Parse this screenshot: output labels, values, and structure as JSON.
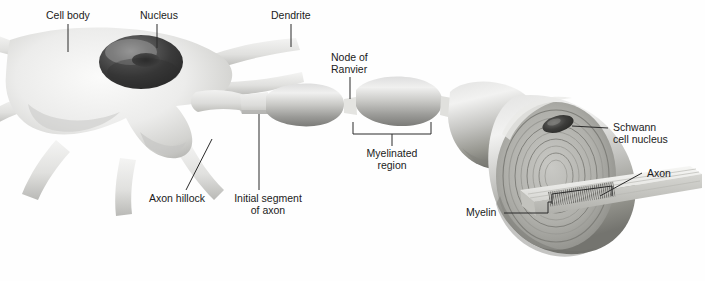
{
  "figure": {
    "background_color": "#fefefe",
    "ink_color": "#1b1b1b"
  },
  "labels": [
    {
      "id": "cell-body",
      "text": "Cell body",
      "x": 46,
      "y": 10,
      "align": "left"
    },
    {
      "id": "nucleus",
      "text": "Nucleus",
      "x": 140,
      "y": 10,
      "align": "left"
    },
    {
      "id": "dendrite",
      "text": "Dendrite",
      "x": 271,
      "y": 10,
      "align": "left"
    },
    {
      "id": "node-of-ranvier",
      "text": "Node of\nRanvier",
      "x": 331,
      "y": 52,
      "align": "left"
    },
    {
      "id": "myelinated-region",
      "text": "Myelinated\nregion",
      "x": 336,
      "y": 148,
      "align": "left"
    },
    {
      "id": "axon-hillock",
      "text": "Axon hillock",
      "x": 149,
      "y": 193,
      "align": "left"
    },
    {
      "id": "initial-segment",
      "text": "Initial segment\nof axon",
      "x": 224,
      "y": 193,
      "align": "left"
    },
    {
      "id": "schwann-nucleus",
      "text": "Schwann\ncell nucleus",
      "x": 613,
      "y": 122,
      "align": "left"
    },
    {
      "id": "axon",
      "text": "Axon",
      "x": 647,
      "y": 168,
      "align": "left"
    },
    {
      "id": "myelin",
      "text": "Myelin",
      "x": 466,
      "y": 209,
      "align": "left"
    }
  ],
  "structures": {
    "soma": "cell-body-with-dendrites",
    "nucleus": "dark-ellipse-with-nucleolus",
    "axon_hillock": "tapered-cone",
    "initial_segment": "thin-pale-tube",
    "myelin_internodes": 4,
    "nodes_of_ranvier": 3,
    "cutaway": "concentric-myelin-wraps-exposing-axon"
  },
  "palette": {
    "membrane_light": "#f2f2f1",
    "membrane_mid": "#d8d8d6",
    "membrane_shadow": "#a9a9a6",
    "nucleus_dark": "#3a3a3a",
    "nucleus_mid": "#6d6d6d",
    "myelin_light": "#e6e6e4",
    "myelin_mid": "#b4b4b1",
    "myelin_dark": "#7d7d7a",
    "axon_pale": "#ececea",
    "leader_line": "#2a2a2a"
  }
}
